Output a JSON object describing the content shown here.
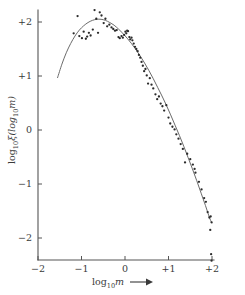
{
  "figure": {
    "background_color": "#ffffff",
    "point_color": "#2b2b2b",
    "curve_color": "#6b6b6b",
    "axis_color": "#555555"
  },
  "axes": {
    "x_title_base": "log",
    "x_title_sub": "10",
    "x_title_var": "m",
    "x_arrow": "→",
    "y_title_base": "log",
    "y_title_sub": "10",
    "y_title_fn": "ξ(log",
    "y_title_sub2": "10",
    "y_title_var": "m)",
    "x_tick_labels": [
      "−2",
      "−1",
      "0",
      "+1",
      "+2"
    ],
    "y_tick_labels": [
      "+2",
      "+1",
      "0",
      "−1",
      "−2"
    ]
  },
  "chart_data": {
    "type": "scatter",
    "title": "",
    "subtitle": "",
    "xlabel": "log10 m",
    "ylabel": "log10 xi(log10 m)",
    "xlim": [
      -2,
      2
    ],
    "ylim": [
      -2.5,
      2.3
    ],
    "xticks": [
      -2,
      -1,
      0,
      1,
      2
    ],
    "yticks": [
      2,
      1,
      0,
      -1,
      -2
    ],
    "grid": false,
    "legend": false,
    "legend_position": "none",
    "series": [
      {
        "name": "observations",
        "type": "scatter",
        "marker": "dot",
        "points": [
          [
            -1.18,
            1.79
          ],
          [
            -1.09,
            2.11
          ],
          [
            -1.05,
            1.74
          ],
          [
            -0.99,
            1.7
          ],
          [
            -0.95,
            1.82
          ],
          [
            -0.9,
            1.69
          ],
          [
            -0.87,
            1.73
          ],
          [
            -0.83,
            1.8
          ],
          [
            -0.79,
            1.75
          ],
          [
            -0.74,
            1.86
          ],
          [
            -0.7,
            2.22
          ],
          [
            -0.66,
            2.06
          ],
          [
            -0.62,
            1.8
          ],
          [
            -0.58,
            2.18
          ],
          [
            -0.54,
            2.12
          ],
          [
            -0.49,
            1.98
          ],
          [
            -0.45,
            2.06
          ],
          [
            -0.41,
            1.92
          ],
          [
            -0.36,
            1.95
          ],
          [
            -0.31,
            1.9
          ],
          [
            -0.27,
            1.87
          ],
          [
            -0.23,
            1.84
          ],
          [
            -0.19,
            1.85
          ],
          [
            -0.15,
            1.72
          ],
          [
            -0.12,
            1.7
          ],
          [
            -0.08,
            1.74
          ],
          [
            -0.05,
            1.71
          ],
          [
            -0.02,
            1.76
          ],
          [
            0.01,
            1.82
          ],
          [
            0.03,
            1.79
          ],
          [
            0.05,
            1.84
          ],
          [
            0.07,
            1.83
          ],
          [
            0.1,
            1.72
          ],
          [
            0.12,
            1.68
          ],
          [
            0.15,
            1.71
          ],
          [
            0.17,
            1.66
          ],
          [
            0.2,
            1.6
          ],
          [
            0.23,
            1.54
          ],
          [
            0.26,
            1.5
          ],
          [
            0.29,
            1.46
          ],
          [
            0.32,
            1.39
          ],
          [
            0.35,
            1.34
          ],
          [
            0.38,
            1.26
          ],
          [
            0.41,
            1.19
          ],
          [
            0.44,
            1.09
          ],
          [
            0.47,
            1.13
          ],
          [
            0.5,
            1.01
          ],
          [
            0.53,
            0.86
          ],
          [
            0.57,
            0.96
          ],
          [
            0.61,
            0.84
          ],
          [
            0.65,
            0.77
          ],
          [
            0.7,
            0.66
          ],
          [
            0.74,
            0.57
          ],
          [
            0.78,
            0.62
          ],
          [
            0.82,
            0.49
          ],
          [
            0.86,
            0.44
          ],
          [
            0.9,
            0.36
          ],
          [
            0.95,
            0.46
          ],
          [
            1.0,
            0.23
          ],
          [
            1.04,
            0.12
          ],
          [
            1.09,
            0.06
          ],
          [
            1.14,
            0.01
          ],
          [
            1.18,
            -0.08
          ],
          [
            1.23,
            -0.16
          ],
          [
            1.28,
            -0.26
          ],
          [
            1.33,
            -0.35
          ],
          [
            1.38,
            -0.6
          ],
          [
            1.43,
            -0.44
          ],
          [
            1.5,
            -0.54
          ],
          [
            1.56,
            -0.64
          ],
          [
            1.6,
            -0.72
          ],
          [
            1.62,
            -0.79
          ],
          [
            1.7,
            -0.96
          ],
          [
            1.76,
            -1.1
          ],
          [
            1.82,
            -1.26
          ],
          [
            1.86,
            -1.33
          ],
          [
            1.9,
            -1.52
          ],
          [
            1.94,
            -1.62
          ],
          [
            1.97,
            -1.6
          ],
          [
            1.99,
            -1.71
          ],
          [
            1.96,
            -1.85
          ],
          [
            1.98,
            -2.3
          ],
          [
            1.99,
            -2.42
          ]
        ]
      },
      {
        "name": "fitted curve",
        "type": "line",
        "points": [
          [
            -1.55,
            0.97
          ],
          [
            -1.45,
            1.22
          ],
          [
            -1.35,
            1.43
          ],
          [
            -1.25,
            1.6
          ],
          [
            -1.15,
            1.74
          ],
          [
            -1.05,
            1.85
          ],
          [
            -0.95,
            1.93
          ],
          [
            -0.85,
            1.99
          ],
          [
            -0.75,
            2.03
          ],
          [
            -0.65,
            2.05
          ],
          [
            -0.55,
            2.05
          ],
          [
            -0.45,
            2.03
          ],
          [
            -0.35,
            1.99
          ],
          [
            -0.25,
            1.94
          ],
          [
            -0.15,
            1.87
          ],
          [
            -0.05,
            1.79
          ],
          [
            0.05,
            1.7
          ],
          [
            0.15,
            1.6
          ],
          [
            0.25,
            1.49
          ],
          [
            0.35,
            1.37
          ],
          [
            0.45,
            1.24
          ],
          [
            0.55,
            1.1
          ],
          [
            0.65,
            0.95
          ],
          [
            0.75,
            0.79
          ],
          [
            0.85,
            0.63
          ],
          [
            0.95,
            0.46
          ],
          [
            1.05,
            0.28
          ],
          [
            1.15,
            0.09
          ],
          [
            1.25,
            -0.1
          ],
          [
            1.35,
            -0.3
          ],
          [
            1.45,
            -0.51
          ],
          [
            1.55,
            -0.72
          ],
          [
            1.65,
            -0.94
          ],
          [
            1.75,
            -1.17
          ],
          [
            1.85,
            -1.4
          ],
          [
            1.95,
            -1.64
          ],
          [
            2.0,
            -1.72
          ]
        ]
      }
    ]
  }
}
